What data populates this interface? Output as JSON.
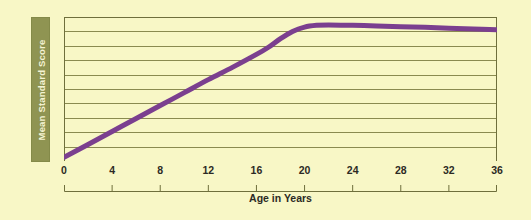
{
  "figure": {
    "background_color": "#f8f7c6",
    "grid_color": "#8a8a50",
    "axis_color": "#6f6f3c",
    "label_box_color": "#8f9452",
    "label_text_color": "#f4f3d2",
    "tick_text_color": "#2c2a24"
  },
  "axes": {
    "y_title": "Mean Standard Score",
    "x_title": "Age in Years"
  },
  "chart_data": {
    "type": "line",
    "title": "",
    "xlabel": "Age in Years",
    "ylabel": "Mean Standard Score",
    "xlim": [
      0,
      36
    ],
    "ylim": [
      0,
      10
    ],
    "xticks": [
      0,
      4,
      8,
      12,
      16,
      20,
      24,
      28,
      32,
      36
    ],
    "xtick_labels": [
      "0",
      "4",
      "8",
      "12",
      "16",
      "20",
      "24",
      "28",
      "32",
      "36"
    ],
    "yticks": [
      0,
      1,
      2,
      3,
      4,
      5,
      6,
      7,
      8,
      9,
      10
    ],
    "ytick_labels": [],
    "grid": true,
    "grid_axis": "y",
    "grid_lines": 9,
    "legend": false,
    "legend_position": "none",
    "line_color": "#7b3f8f",
    "line_width": 5,
    "series": [
      {
        "name": "Mean Standard Score by Age",
        "color": "#7b3f8f",
        "x": [
          0,
          2,
          4,
          6,
          8,
          10,
          12,
          14,
          16,
          17,
          18,
          19,
          20,
          21,
          22,
          24,
          26,
          28,
          30,
          32,
          34,
          36
        ],
        "y": [
          0.25,
          1.15,
          2.05,
          2.95,
          3.85,
          4.75,
          5.65,
          6.5,
          7.4,
          7.9,
          8.5,
          9.0,
          9.3,
          9.42,
          9.45,
          9.42,
          9.38,
          9.33,
          9.28,
          9.22,
          9.17,
          9.12
        ]
      }
    ],
    "annotations": [
      "Score rises steeply and nearly linearly from age 0 to about age 17",
      "Curve bends and plateaus at a peak near age 21-22",
      "A very slight decline follows from the early twenties through age 36"
    ]
  }
}
